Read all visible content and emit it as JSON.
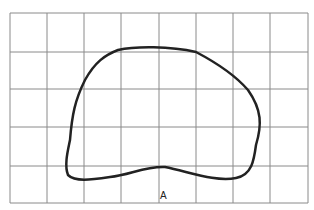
{
  "figure": {
    "label": "A",
    "grid": {
      "columns": 8,
      "rows": 5,
      "x_lines": [
        10,
        47,
        84,
        121,
        159,
        196,
        233,
        270,
        308
      ],
      "y_lines": [
        13,
        52,
        89,
        127,
        166,
        203
      ],
      "line_color": "#8a8a8a"
    },
    "outline": {
      "stroke_color": "#222222",
      "shape": "closed irregular blob"
    }
  }
}
